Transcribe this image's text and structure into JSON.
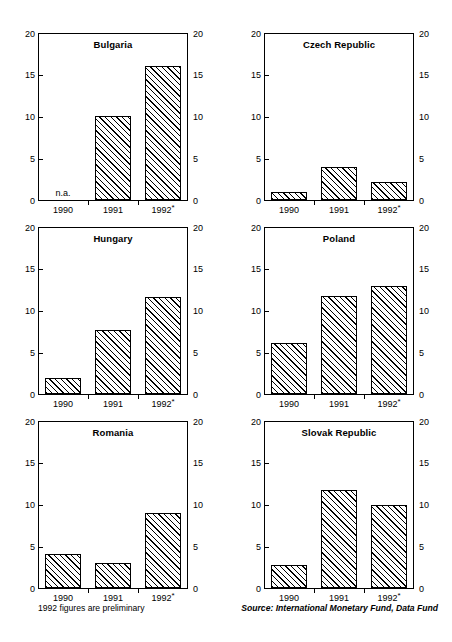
{
  "footer": {
    "note": "1992 figures are preliminary",
    "source": "Source: International Monetary Fund, Data Fund"
  },
  "axis": {
    "y_ticks": [
      "0",
      "5",
      "10",
      "15",
      "20"
    ],
    "x_labels": [
      "1990",
      "1991",
      "1992*"
    ],
    "na_text": "n.a."
  },
  "chart_data": {
    "type": "bar",
    "title": "",
    "subtitle": "",
    "xlabel": "",
    "ylabel": "",
    "ylim": [
      0,
      20
    ],
    "yticks": [
      0,
      5,
      10,
      15,
      20
    ],
    "grid": false,
    "legend": "none",
    "categories": [
      "1990",
      "1991",
      "1992*"
    ],
    "notes": [
      "1992 figures are preliminary",
      "Bulgaria 1990 value is not available (n.a.)"
    ],
    "source": "Source: International Monetary Fund, Data Fund",
    "panels": [
      {
        "name": "Bulgaria",
        "values": [
          null,
          10.1,
          16.1
        ],
        "value_labels": [
          "n.a.",
          "10.1",
          "16.1"
        ]
      },
      {
        "name": "Czech Republic",
        "values": [
          1.0,
          4.0,
          2.2
        ],
        "value_labels": [
          "1.0",
          "4.0",
          "2.2"
        ]
      },
      {
        "name": "Hungary",
        "values": [
          1.9,
          7.7,
          11.6
        ],
        "value_labels": [
          "1.9",
          "7.7",
          "11.6"
        ]
      },
      {
        "name": "Poland",
        "values": [
          6.1,
          11.7,
          12.9
        ],
        "value_labels": [
          "6.1",
          "11.7",
          "12.9"
        ]
      },
      {
        "name": "Romania",
        "values": [
          4.1,
          3.0,
          9.0
        ],
        "value_labels": [
          "4.1",
          "3.0",
          "9.0"
        ]
      },
      {
        "name": "Slovak Republic",
        "values": [
          2.7,
          11.7,
          10.0
        ],
        "value_labels": [
          "2.7",
          "11.7",
          "10.0"
        ]
      }
    ]
  }
}
